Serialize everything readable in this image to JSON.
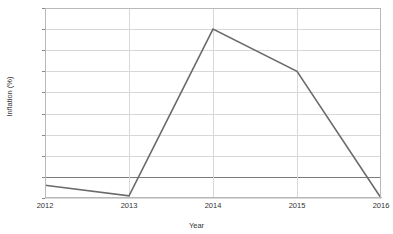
{
  "chart_data": {
    "type": "line",
    "title": "",
    "xlabel": "Year",
    "ylabel": "Inflation (%)",
    "categories": [
      "2012",
      "2013",
      "2014",
      "2015",
      "2016"
    ],
    "x": [
      2012,
      2013,
      2014,
      2015,
      2016
    ],
    "values": [
      -0.2,
      -0.45,
      3.5,
      2.5,
      -0.5
    ],
    "series": [
      {
        "name": "Inflation",
        "values": [
          -0.2,
          -0.45,
          3.5,
          2.5,
          -0.5
        ],
        "color": "#6b6b6b"
      }
    ],
    "ylim": [
      -0.5,
      4
    ],
    "xlim": [
      2012,
      2016
    ],
    "ytick_labels": [
      "4",
      "3.5",
      "3",
      "2.5",
      "2",
      "1.5",
      "1",
      "0.5",
      "0",
      "-0.5"
    ],
    "ytick_values": [
      4,
      3.5,
      3,
      2.5,
      2,
      1.5,
      1,
      0.5,
      0,
      -0.5
    ],
    "xtick_labels": [
      "2012",
      "2013",
      "2014",
      "2015",
      "2016"
    ],
    "grid": true,
    "grid_color": "#d8d8d8",
    "zero_line": true,
    "zero_line_color": "#7a7a7a",
    "legend": false,
    "legend_position": "none",
    "markers": false
  },
  "colors": {
    "background": "#ffffff",
    "series": "#6b6b6b",
    "grid": "#d8d8d8",
    "axis": "#b9b9b9",
    "text": "#333333"
  }
}
